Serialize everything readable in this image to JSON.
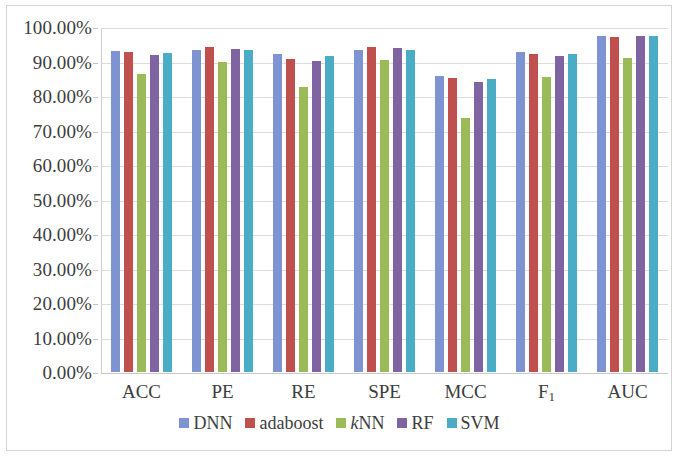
{
  "chart_data": {
    "type": "bar",
    "title": "",
    "subtitle": "",
    "xlabel": "",
    "ylabel": "",
    "ylim": [
      0,
      100
    ],
    "ytick_step": 10,
    "grid": true,
    "legend_position": "bottom",
    "value_suffix": "%",
    "categories": [
      "ACC",
      "PE",
      "RE",
      "SPE",
      "MCC",
      "F₁",
      "AUC"
    ],
    "category_labels_html": [
      "ACC",
      "PE",
      "RE",
      "SPE",
      "MCC",
      "F<sub>1</sub>",
      "AUC"
    ],
    "ytick_labels": [
      "100.00%",
      "90.00%",
      "80.00%",
      "70.00%",
      "60.00%",
      "50.00%",
      "40.00%",
      "30.00%",
      "20.00%",
      "10.00%",
      "0.00%"
    ],
    "ytick_values": [
      100,
      90,
      80,
      70,
      60,
      50,
      40,
      30,
      20,
      10,
      0
    ],
    "series": [
      {
        "name": "DNN",
        "color": "#7e93d2",
        "values": [
          93.5,
          94.0,
          92.7,
          93.9,
          86.3,
          93.3,
          98.1
        ]
      },
      {
        "name": "adaboost",
        "color": "#c0504d",
        "values": [
          93.2,
          94.7,
          91.4,
          94.8,
          85.7,
          92.9,
          97.7
        ]
      },
      {
        "name": "kNN",
        "color": "#9bbb59",
        "values": [
          87.0,
          90.3,
          83.1,
          91.0,
          74.1,
          86.2,
          91.7
        ]
      },
      {
        "name": "RF",
        "color": "#8064a2",
        "values": [
          92.5,
          94.3,
          90.6,
          94.4,
          84.6,
          92.2,
          97.9
        ]
      },
      {
        "name": "SVM",
        "color": "#4bacc6",
        "values": [
          93.0,
          93.9,
          92.1,
          93.9,
          85.5,
          92.9,
          98.0
        ]
      }
    ]
  },
  "legend": {
    "items": [
      {
        "label": "DNN",
        "label_html": "DNN",
        "color": "#7e93d2"
      },
      {
        "label": "adaboost",
        "label_html": "adaboost",
        "color": "#c0504d"
      },
      {
        "label": "kNN",
        "label_html": "<span class=\"ital\">k</span>NN",
        "color": "#9bbb59"
      },
      {
        "label": "RF",
        "label_html": "RF",
        "color": "#8064a2"
      },
      {
        "label": "SVM",
        "label_html": "SVM",
        "color": "#4bacc6"
      }
    ]
  },
  "colors": {
    "dnn": "#7e93d2",
    "adaboost": "#c0504d",
    "knn": "#9bbb59",
    "rf": "#8064a2",
    "svm": "#4bacc6",
    "gridline": "#dcdcdc",
    "frame_border": "#d4d4d4",
    "text": "#3d3d3d",
    "background": "#ffffff"
  }
}
